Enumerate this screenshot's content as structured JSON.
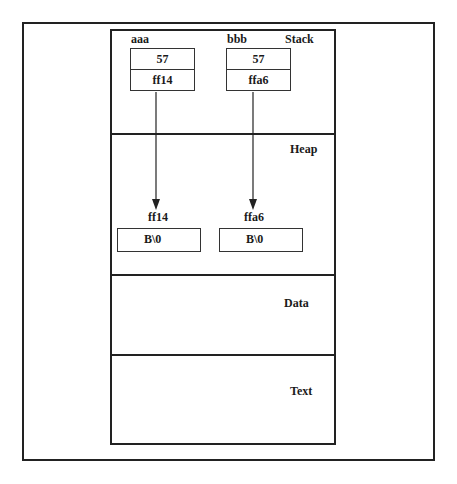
{
  "segments": {
    "stack": {
      "label": "Stack"
    },
    "heap": {
      "label": "Heap"
    },
    "data": {
      "label": "Data"
    },
    "text": {
      "label": "Text"
    }
  },
  "stack_vars": [
    {
      "name": "aaa",
      "value": "57",
      "pointer": "ff14"
    },
    {
      "name": "bbb",
      "value": "57",
      "pointer": "ffa6"
    }
  ],
  "heap_blocks": [
    {
      "address": "ff14",
      "content": "B\\0"
    },
    {
      "address": "ffa6",
      "content": "B\\0"
    }
  ],
  "colors": {
    "line": "#222222",
    "background": "#ffffff"
  }
}
